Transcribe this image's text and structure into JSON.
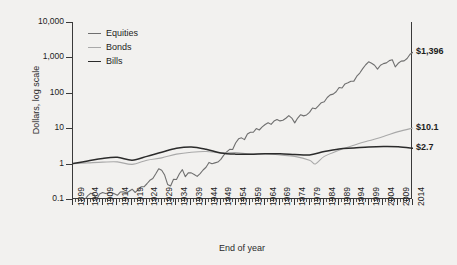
{
  "chart_data": {
    "type": "line",
    "title": "",
    "xlabel": "End of year",
    "ylabel": "Dollars, log scale",
    "log_y": true,
    "ylim": [
      0.1,
      10000
    ],
    "ytick_labels": [
      "10,000",
      "1,000",
      "100",
      "10",
      "1",
      "0.1"
    ],
    "ytick_values": [
      10000,
      1000,
      100,
      10,
      1,
      0.1
    ],
    "xlim": [
      1899,
      2014
    ],
    "grid": false,
    "legend_position": "top-left",
    "xtick_labels": [
      "1899",
      "1904",
      "1909",
      "1914",
      "1919",
      "1924",
      "1929",
      "1934",
      "1939",
      "1944",
      "1949",
      "1954",
      "1959",
      "1964",
      "1969",
      "1974",
      "1979",
      "1984",
      "1989",
      "1994",
      "1999",
      "2004",
      "2009",
      "2014"
    ],
    "xtick_values": [
      1899,
      1904,
      1909,
      1914,
      1919,
      1924,
      1929,
      1934,
      1939,
      1944,
      1949,
      1954,
      1959,
      1964,
      1969,
      1974,
      1979,
      1984,
      1989,
      1994,
      1999,
      2004,
      2009,
      2014
    ],
    "minor_tick_interval": 1,
    "colors": {
      "equities": "#6f6f6f",
      "bonds": "#a9a9a9",
      "bills": "#2b2b2b"
    },
    "end_labels": [
      {
        "series": "Equities",
        "text": "$1,396",
        "value": 1396
      },
      {
        "series": "Bonds",
        "text": "$10.1",
        "value": 10.1
      },
      {
        "series": "Bills",
        "text": "$2.7",
        "value": 2.7
      }
    ],
    "series": [
      {
        "name": "Equities",
        "color": "#6f6f6f",
        "x": [
          1899,
          1900,
          1901,
          1902,
          1903,
          1904,
          1905,
          1906,
          1907,
          1908,
          1909,
          1910,
          1911,
          1912,
          1913,
          1914,
          1915,
          1916,
          1917,
          1918,
          1919,
          1920,
          1921,
          1922,
          1923,
          1924,
          1925,
          1926,
          1927,
          1928,
          1929,
          1930,
          1931,
          1932,
          1933,
          1934,
          1935,
          1936,
          1937,
          1938,
          1939,
          1940,
          1941,
          1942,
          1943,
          1944,
          1945,
          1946,
          1947,
          1948,
          1949,
          1950,
          1951,
          1952,
          1953,
          1954,
          1955,
          1956,
          1957,
          1958,
          1959,
          1960,
          1961,
          1962,
          1963,
          1964,
          1965,
          1966,
          1967,
          1968,
          1969,
          1970,
          1971,
          1972,
          1973,
          1974,
          1975,
          1976,
          1977,
          1978,
          1979,
          1980,
          1981,
          1982,
          1983,
          1984,
          1985,
          1986,
          1987,
          1988,
          1989,
          1990,
          1991,
          1992,
          1993,
          1994,
          1995,
          1996,
          1997,
          1998,
          1999,
          2000,
          2001,
          2002,
          2003,
          2004,
          2005,
          2006,
          2007,
          2008,
          2009,
          2010,
          2011,
          2012,
          2013,
          2014
        ],
        "values": [
          1,
          1.08,
          1.25,
          1.3,
          1.18,
          1.55,
          1.8,
          1.72,
          1.2,
          1.72,
          1.9,
          1.78,
          1.84,
          1.9,
          1.74,
          1.58,
          1.95,
          2.0,
          1.85,
          2.05,
          2.35,
          1.9,
          2.25,
          2.75,
          2.75,
          3.35,
          4.2,
          4.7,
          6.4,
          8.9,
          8.1,
          5.9,
          3.2,
          2.9,
          4.5,
          4.4,
          6.4,
          8.4,
          5.3,
          6.8,
          6.8,
          6.1,
          5.4,
          6.5,
          8.2,
          9.8,
          13.4,
          12.3,
          13.0,
          13.7,
          16.3,
          21.5,
          26.6,
          31.5,
          31.1,
          47.5,
          62.3,
          66.3,
          59.1,
          84.9,
          95.0,
          95.5,
          121.0,
          110.5,
          135.5,
          157.8,
          177.4,
          159.5,
          197.5,
          219.0,
          200.0,
          208.0,
          237.0,
          282.0,
          240.0,
          176.0,
          241.0,
          299.0,
          277.0,
          295.0,
          349.0,
          462.0,
          439.0,
          533.0,
          653.0,
          694.0,
          914.0,
          1084.0,
          1141.0,
          1330.0,
          1751.0,
          1697.0,
          2213.0,
          2382.0,
          2621.0,
          2656.0,
          3653.0,
          4492.0,
          5990.0,
          7700.0,
          9320.0,
          8470.0,
          7460.0,
          5810.0,
          7475.0,
          8290.0,
          8695.0,
          10065.0,
          10620.0,
          6690.0,
          8460.0,
          9735.0,
          9940.0,
          11530.0,
          15260.0,
          17340.0
        ],
        "note": "cumulative real/nominal index rebased; plotted value at 2014 is 1396 on the displayed scale"
      },
      {
        "name": "Bonds",
        "color": "#a9a9a9",
        "x": [
          1899,
          1904,
          1909,
          1914,
          1919,
          1924,
          1929,
          1934,
          1939,
          1944,
          1949,
          1954,
          1959,
          1964,
          1969,
          1974,
          1979,
          1981,
          1984,
          1989,
          1994,
          1999,
          2004,
          2009,
          2014
        ],
        "values": [
          1,
          1.05,
          1.1,
          1.12,
          0.95,
          1.25,
          1.45,
          1.85,
          2.1,
          2.2,
          2.0,
          2.05,
          1.85,
          1.9,
          1.75,
          1.6,
          1.25,
          0.98,
          1.6,
          2.4,
          3.3,
          4.4,
          5.8,
          8.0,
          10.1
        ]
      },
      {
        "name": "Bills",
        "color": "#2b2b2b",
        "x": [
          1899,
          1904,
          1909,
          1914,
          1919,
          1924,
          1929,
          1934,
          1939,
          1944,
          1949,
          1954,
          1959,
          1964,
          1969,
          1974,
          1979,
          1984,
          1989,
          1994,
          1999,
          2004,
          2009,
          2014
        ],
        "values": [
          1,
          1.18,
          1.4,
          1.5,
          1.25,
          1.6,
          2.1,
          2.7,
          2.95,
          2.55,
          2.0,
          1.85,
          1.85,
          1.9,
          1.9,
          1.82,
          1.75,
          2.2,
          2.6,
          2.75,
          2.95,
          3.05,
          3.0,
          2.7
        ]
      }
    ]
  },
  "legend": {
    "items": [
      {
        "label": "Equities",
        "color": "#6f6f6f"
      },
      {
        "label": "Bonds",
        "color": "#a9a9a9"
      },
      {
        "label": "Bills",
        "color": "#2b2b2b"
      }
    ]
  },
  "axes": {
    "y_title": "Dollars, log scale",
    "x_title": "End of year"
  }
}
